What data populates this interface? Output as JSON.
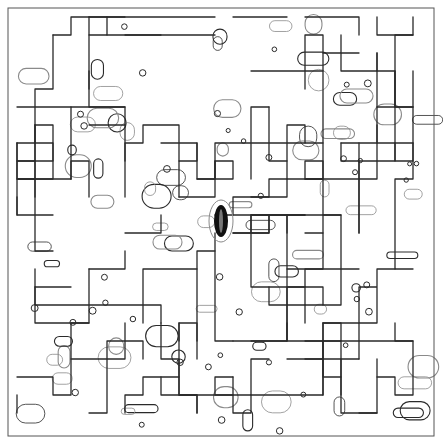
{
  "artwork": {
    "title": "Maze line art",
    "width": 443,
    "height": 446,
    "frame": {
      "x": 8,
      "y": 8,
      "w": 426,
      "h": 428
    },
    "grid_step": 18,
    "seed": 7,
    "colors": {
      "background": "#ffffff",
      "main_line": "#2a2a2a",
      "contour_line": "#8a8a8a",
      "frame": "#555555",
      "center_blob": "#111111"
    },
    "center_blob": {
      "cx": 221,
      "cy": 221,
      "rx": 7,
      "ry": 16
    }
  }
}
